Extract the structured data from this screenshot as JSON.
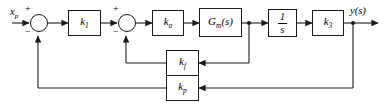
{
  "diagram": {
    "type": "control-system-block-diagram",
    "title": "",
    "signals": {
      "input_label": "x",
      "input_subscript": "p",
      "output_label": "y(s)"
    },
    "summing_junctions": [
      {
        "id": "sum1",
        "plus_sign": "+",
        "minus_sign": "−",
        "plus_position": "top-left",
        "minus_position": "bottom-left",
        "feedback_source": "k_p"
      },
      {
        "id": "sum2",
        "plus_sign": "+",
        "minus_sign": "−",
        "plus_position": "top-left",
        "minus_position": "bottom-left",
        "feedback_source": "k_f"
      }
    ],
    "forward_blocks": [
      {
        "id": "k1",
        "base": "k",
        "sub": "1",
        "label": "k₁"
      },
      {
        "id": "ka",
        "base": "k",
        "sub": "a",
        "label": "kₐ"
      },
      {
        "id": "gm",
        "base": "G",
        "sub": "m",
        "suffix": "(s)",
        "label": "Gₘ(s)"
      },
      {
        "id": "integrator",
        "numerator": "1",
        "denominator": "s",
        "label": "1/s"
      },
      {
        "id": "k3",
        "base": "k",
        "sub": "3",
        "label": "k₃"
      }
    ],
    "feedback_blocks": [
      {
        "id": "kf",
        "base": "k",
        "sub": "f",
        "label": "k_f",
        "loop": "inner",
        "from": "gm-output",
        "to": "sum2"
      },
      {
        "id": "kp",
        "base": "k",
        "sub": "p",
        "label": "k_p",
        "loop": "outer",
        "from": "y(s)",
        "to": "sum1"
      }
    ],
    "colors": {
      "line": "#1a1a1a",
      "background": "#ffffff",
      "text": "#000000"
    }
  }
}
